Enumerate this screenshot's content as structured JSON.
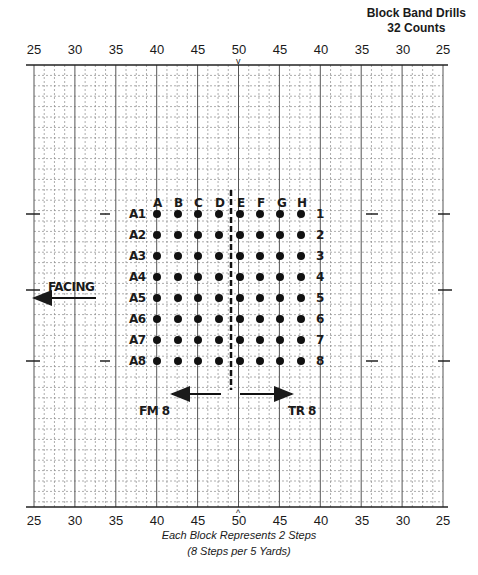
{
  "title": {
    "line1": "Block Band Drills",
    "line2": "32 Counts"
  },
  "yard_labels_top": [
    "25",
    "30",
    "35",
    "40",
    "45",
    "50",
    "45",
    "40",
    "35",
    "30",
    "25"
  ],
  "yard_labels_bottom": [
    "25",
    "30",
    "35",
    "40",
    "45",
    "50",
    "45",
    "40",
    "35",
    "30",
    "25"
  ],
  "center_marker_top": "v",
  "center_marker_bottom": "^",
  "caption": {
    "line1": "Each Block Represents 2 Steps",
    "line2": "(8 Steps per 5 Yards)"
  },
  "facing": {
    "label": "FACING",
    "direction": "left"
  },
  "formation": {
    "columns": [
      "A",
      "B",
      "C",
      "D",
      "E",
      "F",
      "G",
      "H"
    ],
    "rows_left": [
      "A1",
      "A2",
      "A3",
      "A4",
      "A5",
      "A6",
      "A7",
      "A8"
    ],
    "rows_right": [
      "1",
      "2",
      "3",
      "4",
      "5",
      "6",
      "7",
      "8"
    ],
    "dot_count": 64,
    "split_between": [
      "D",
      "E"
    ]
  },
  "moves": {
    "left": {
      "label": "FM 8",
      "direction": "left"
    },
    "right": {
      "label": "TR 8",
      "direction": "right"
    }
  },
  "colors": {
    "ink": "#1a1a1a",
    "grid": "#8a8a8a",
    "paper": "#ffffff"
  }
}
